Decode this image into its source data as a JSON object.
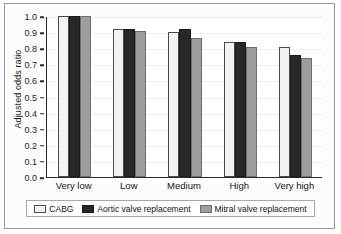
{
  "chart_data": {
    "type": "bar",
    "title": "",
    "xlabel": "",
    "ylabel": "Adjusted odds ratio",
    "ylim": [
      0.0,
      1.0
    ],
    "yticks": [
      "0.0",
      "0.1",
      "0.2",
      "0.3",
      "0.4",
      "0.5",
      "0.6",
      "0.7",
      "0.8",
      "0.9",
      "1.0"
    ],
    "ytick_values": [
      0.0,
      0.1,
      0.2,
      0.3,
      0.4,
      0.5,
      0.6,
      0.7,
      0.8,
      0.9,
      1.0
    ],
    "grid": true,
    "legend_position": "bottom",
    "categories": [
      "Very low",
      "Low",
      "Medium",
      "High",
      "Very high"
    ],
    "series": [
      {
        "name": "CABG",
        "color": "#f2f2f2",
        "values": [
          1.0,
          0.92,
          0.9,
          0.84,
          0.805
        ]
      },
      {
        "name": "Aortic valve replacement",
        "color": "#282828",
        "values": [
          1.0,
          0.92,
          0.92,
          0.84,
          0.755
        ]
      },
      {
        "name": "Mitral valve replacement",
        "color": "#9d9d9d",
        "values": [
          1.0,
          0.91,
          0.865,
          0.81,
          0.74
        ]
      }
    ]
  }
}
